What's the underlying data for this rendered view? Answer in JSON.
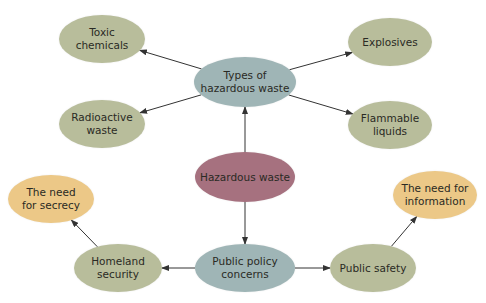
{
  "colors": {
    "leaf": "#b8bd9b",
    "category": "#9fb5b6",
    "root": "#a6717f",
    "need": "#ecc887",
    "edge": "#333333"
  },
  "nodes": {
    "root": {
      "label": "Hazardous waste",
      "cx": 245,
      "cy": 177,
      "w": 100,
      "h": 50
    },
    "types": {
      "label": "Types of\nhazardous waste",
      "cx": 245,
      "cy": 82,
      "w": 102,
      "h": 50
    },
    "toxic": {
      "label": "Toxic\nchemicals",
      "cx": 102,
      "cy": 39,
      "w": 86,
      "h": 48
    },
    "radioactive": {
      "label": "Radioactive\nwaste",
      "cx": 102,
      "cy": 124,
      "w": 86,
      "h": 48
    },
    "explosives": {
      "label": "Explosives",
      "cx": 390,
      "cy": 42,
      "w": 84,
      "h": 48
    },
    "flammable": {
      "label": "Flammable\nliquids",
      "cx": 390,
      "cy": 125,
      "w": 84,
      "h": 48
    },
    "policy": {
      "label": "Public policy\nconcerns",
      "cx": 245,
      "cy": 268,
      "w": 100,
      "h": 48
    },
    "homeland": {
      "label": "Homeland\nsecurity",
      "cx": 118,
      "cy": 268,
      "w": 88,
      "h": 48
    },
    "safety": {
      "label": "Public safety",
      "cx": 373,
      "cy": 268,
      "w": 86,
      "h": 48
    },
    "secrecy": {
      "label": "The need\nfor secrecy",
      "cx": 51,
      "cy": 199,
      "w": 86,
      "h": 48
    },
    "information": {
      "label": "The need for\ninformation",
      "cx": 435,
      "cy": 195,
      "w": 84,
      "h": 48
    }
  },
  "edges": [
    {
      "from": "root",
      "to": "types"
    },
    {
      "from": "types",
      "to": "toxic"
    },
    {
      "from": "types",
      "to": "radioactive"
    },
    {
      "from": "types",
      "to": "explosives"
    },
    {
      "from": "types",
      "to": "flammable"
    },
    {
      "from": "root",
      "to": "policy"
    },
    {
      "from": "policy",
      "to": "homeland"
    },
    {
      "from": "policy",
      "to": "safety"
    },
    {
      "from": "homeland",
      "to": "secrecy"
    },
    {
      "from": "safety",
      "to": "information"
    }
  ]
}
